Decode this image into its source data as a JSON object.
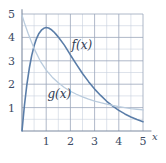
{
  "figure": {
    "background": "#ffffff",
    "axis_color": "#7d8aa0",
    "grid_major_color": "#9aa6ba",
    "grid_minor_color": "#c8d0dd"
  },
  "axes": {
    "x_axis_name": "x",
    "y_axis_name": "",
    "x_ticks": [
      "1",
      "2",
      "3",
      "4",
      "5"
    ],
    "y_ticks": [
      "1",
      "2",
      "3",
      "4",
      "5"
    ]
  },
  "labels": {
    "f_label": "f(x)",
    "g_label": "g(x)"
  },
  "chart_data": {
    "type": "line",
    "title": "",
    "xlabel": "x",
    "ylabel": "",
    "xlim": [
      0,
      5.35
    ],
    "ylim": [
      0,
      5.2
    ],
    "grid": true,
    "grid_major_step": 1,
    "grid_minor_step": 0.5,
    "legend": "inline-annotations",
    "annotations": [
      {
        "text": "f(x)",
        "x": 2.05,
        "y": 3.52
      },
      {
        "text": "g(x)",
        "x": 1.05,
        "y": 1.42
      }
    ],
    "series": [
      {
        "name": "f(x)",
        "color": "#5a7da8",
        "width": 1.6,
        "x": [
          0,
          0.1,
          0.2,
          0.3,
          0.4,
          0.5,
          0.6,
          0.7,
          0.8,
          0.9,
          1.0,
          1.1,
          1.2,
          1.3,
          1.4,
          1.5,
          1.75,
          2.0,
          2.25,
          2.5,
          2.75,
          3.0,
          3.25,
          3.5,
          3.75,
          4.0,
          4.25,
          4.5,
          4.75,
          5.0
        ],
        "values": [
          0,
          1.09,
          1.97,
          2.67,
          3.22,
          3.64,
          3.95,
          4.17,
          4.31,
          4.39,
          4.42,
          4.4,
          4.34,
          4.25,
          4.14,
          4.02,
          3.67,
          3.25,
          2.85,
          2.46,
          2.11,
          1.79,
          1.52,
          1.27,
          1.06,
          0.88,
          0.73,
          0.6,
          0.49,
          0.4
        ]
      },
      {
        "name": "g(x)",
        "color": "#b9cbdd",
        "width": 1.3,
        "x": [
          0,
          0.1,
          0.25,
          0.5,
          0.75,
          1.0,
          1.25,
          1.5,
          1.75,
          2.0,
          2.25,
          2.5,
          2.75,
          3.0,
          3.25,
          3.5,
          3.75,
          4.0,
          4.25,
          4.5,
          4.75,
          5.0
        ],
        "values": [
          4.95,
          4.62,
          4.18,
          3.52,
          3.0,
          2.6,
          2.3,
          2.06,
          1.86,
          1.7,
          1.57,
          1.46,
          1.36,
          1.28,
          1.21,
          1.15,
          1.09,
          1.04,
          1.0,
          0.96,
          0.93,
          0.9
        ]
      }
    ]
  }
}
